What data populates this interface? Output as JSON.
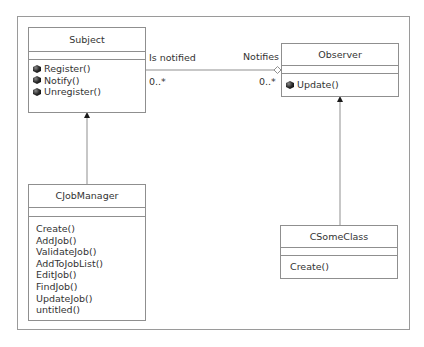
{
  "diagram": {
    "type": "UML class diagram",
    "classes": {
      "subject": {
        "name": "Subject",
        "operations": [
          "Register()",
          "Notify()",
          "Unregister()"
        ],
        "operation_icon": "method-gem-icon"
      },
      "observer": {
        "name": "Observer",
        "operations": [
          "Update()"
        ],
        "operation_icon": "method-gem-icon"
      },
      "cjobmanager": {
        "name": "CJobManager",
        "operations": [
          "Create()",
          "AddJob()",
          "ValidateJob()",
          "AddToJobList()",
          "EditJob()",
          "FindJob()",
          "UpdateJob()",
          "untitled()"
        ]
      },
      "csomeclass": {
        "name": "CSomeClass",
        "operations": [
          "Create()"
        ]
      }
    },
    "association": {
      "from": "Subject",
      "to": "Observer",
      "kind": "aggregation",
      "subject_role": "Is notified",
      "subject_multiplicity": "0..*",
      "observer_role": "Notifies",
      "observer_multiplicity": "0..*"
    },
    "generalizations": [
      {
        "child": "CJobManager",
        "parent": "Subject"
      },
      {
        "child": "CSomeClass",
        "parent": "Observer"
      }
    ],
    "colors": {
      "line": "#8f8f8f",
      "frame": "#9a9a9a",
      "text": "#333333",
      "arrowhead": "#1a1a1a"
    }
  }
}
